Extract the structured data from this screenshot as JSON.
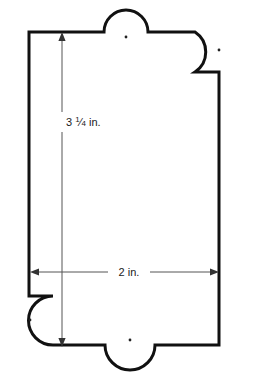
{
  "figure": {
    "stroke_color": "#111111",
    "fill_color": "#ffffff",
    "dimension_line_color": "#555555",
    "dot_color": "#222222",
    "outline_width": 3,
    "dimension_width": 1
  },
  "dimensions": {
    "vertical": {
      "value": "3 1/4",
      "whole": "3",
      "numerator": "1",
      "denominator": "4",
      "unit": "in.",
      "label": "3 1/4 in."
    },
    "horizontal": {
      "value": "2",
      "unit": "in.",
      "label": "2 in."
    }
  },
  "features": {
    "tabs": [
      {
        "name": "top-tab",
        "cx": 126,
        "cy": 32,
        "r": 22
      },
      {
        "name": "bottom-tab",
        "cx": 130,
        "cy": 345,
        "r": 25
      },
      {
        "name": "top-right-lobe",
        "cx": 217,
        "cy": 48,
        "r": 24
      },
      {
        "name": "bottom-left-lobe",
        "cx": 31,
        "cy": 320,
        "r": 24
      }
    ],
    "holes": [
      {
        "name": "top-tab-hole",
        "cx": 126,
        "cy": 37
      },
      {
        "name": "bottom-tab-hole",
        "cx": 130,
        "cy": 340
      },
      {
        "name": "top-right-lobe-hole",
        "cx": 219,
        "cy": 50
      },
      {
        "name": "bottom-left-lobe-hole",
        "cx": 30,
        "cy": 320
      }
    ]
  }
}
